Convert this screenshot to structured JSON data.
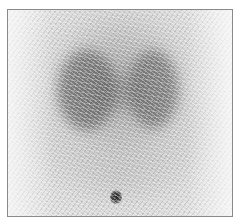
{
  "image": {
    "type": "scintigraphy-scan",
    "description": "Grayscale nuclear medicine scan showing two darker lobes with a small dark marker spot near the bottom center",
    "colors": {
      "background": "#ffffff",
      "frame_border": "#8a8a8a",
      "field": "#f2f2f2",
      "uptake": "#464646",
      "marker": "#222222"
    },
    "regions": [
      {
        "name": "left-lobe",
        "intensity": "high"
      },
      {
        "name": "right-lobe",
        "intensity": "high"
      },
      {
        "name": "marker-spot",
        "intensity": "very-high"
      }
    ]
  }
}
